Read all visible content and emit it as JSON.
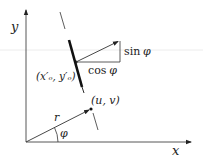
{
  "diagram": {
    "axes": {
      "x_label": "x",
      "y_label": "y"
    },
    "labels": {
      "point_o": "(x′ₒ, y′ₒ)",
      "point_uv": "(u, v)",
      "radius": "r",
      "angle": "φ",
      "sin_label_fn": "sin",
      "sin_label_var": "φ",
      "cos_label_fn": "cos",
      "cos_label_var": "φ"
    },
    "colors": {
      "ink": "#222222",
      "artifact_line": "#e6e6e6"
    }
  }
}
